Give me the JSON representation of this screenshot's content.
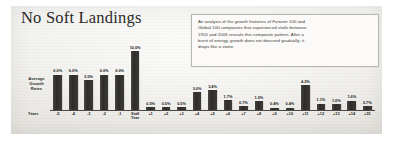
{
  "figure": {
    "title": "No Soft Landings",
    "y_axis_caption": "Average Growth Rates",
    "years_caption": "Years"
  },
  "callout": {
    "line1_a": "An analysis of the growth histories of ",
    "line1_em": "Fortune",
    "line1_b": " 100 and",
    "line2": "Global 100 companies that experienced stalls between",
    "line3": "1955 and 2006 reveals this composite pattern. After a",
    "line4": "burst of energy, growth does not descend gradually; it",
    "line5": "drops like a stone."
  },
  "chart_data": {
    "type": "bar",
    "title": "No Soft Landings",
    "xlabel": "Years",
    "ylabel": "Average Growth Rates",
    "ylim": [
      0,
      11
    ],
    "grid": false,
    "legend": "none",
    "annotation": "An analysis of the growth histories of Fortune 100 and Global 100 companies that experienced stalls between 1955 and 2006 reveals this composite pattern. After a burst of energy, growth does not descend gradually; it drops like a stone.",
    "categories": [
      "-5",
      "-4",
      "-3",
      "-2",
      "-1",
      "Stall Year",
      "+1",
      "+2",
      "+3",
      "+4",
      "+5",
      "+6",
      "+7",
      "+8",
      "+9",
      "+10",
      "+11",
      "+12",
      "+13",
      "+14",
      "+15"
    ],
    "values": [
      6.0,
      6.0,
      5.0,
      6.0,
      6.0,
      10.0,
      0.5,
      0.5,
      0.5,
      3.0,
      3.4,
      1.7,
      0.7,
      1.5,
      0.4,
      0.4,
      4.2,
      1.1,
      1.0,
      1.6,
      0.7
    ],
    "labels": [
      "6.0%",
      "6.0%",
      "5.0%",
      "6.0%",
      "6.0%",
      "10.0%",
      "0.5%",
      "0.5%",
      "0.5%",
      "3.0%",
      "3.4%",
      "1.7%",
      "0.7%",
      "1.5%",
      "0.4%",
      "0.4%",
      "4.2%",
      "1.1%",
      "1.0%",
      "1.6%",
      "0.7%"
    ],
    "bar_color": "#332f2c"
  }
}
